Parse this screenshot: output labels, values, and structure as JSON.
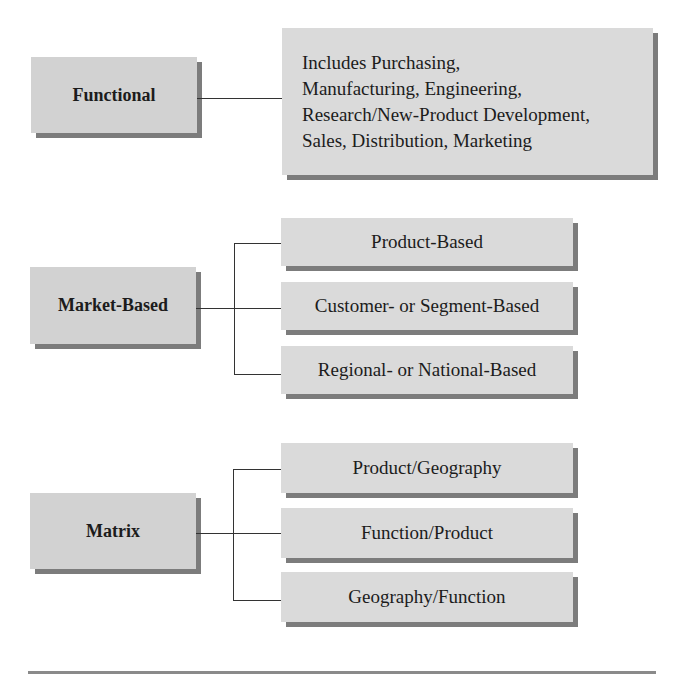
{
  "diagram": {
    "groups": [
      {
        "label": "Functional",
        "detail": "Includes Purchasing,\nManufacturing, Engineering,\nResearch/New-Product Development,\nSales, Distribution, Marketing"
      },
      {
        "label": "Market-Based",
        "children": [
          "Product-Based",
          "Customer- or Segment-Based",
          "Regional- or National-Based"
        ]
      },
      {
        "label": "Matrix",
        "children": [
          "Product/Geography",
          "Function/Product",
          "Geography/Function"
        ]
      }
    ],
    "colors": {
      "box_fill": "#dadada",
      "box_shadow": "#7c7c7c",
      "connector": "#333333",
      "text": "#1c1c1c"
    }
  }
}
